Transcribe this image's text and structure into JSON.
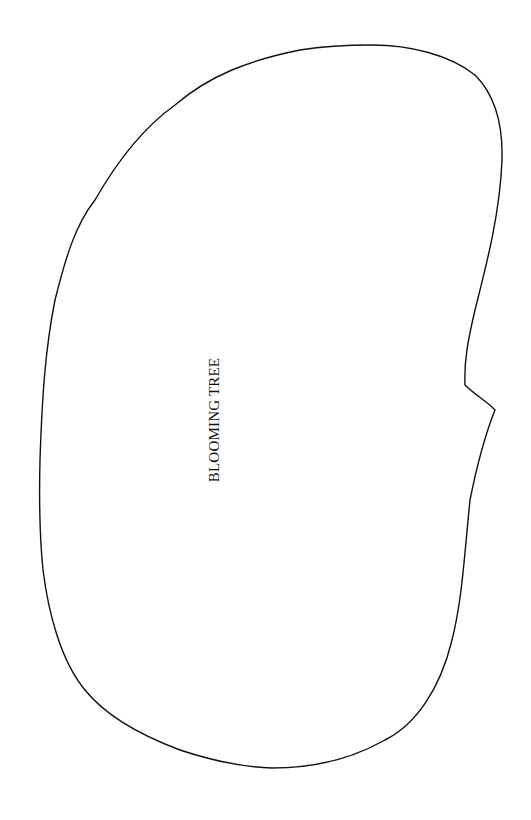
{
  "diagram": {
    "shape": "blob-outline",
    "stroke_color": "#111111",
    "background_color": "#ffffff",
    "label": "BLOOMING TREE",
    "label_orientation": "vertical-rotated-90-ccw"
  }
}
